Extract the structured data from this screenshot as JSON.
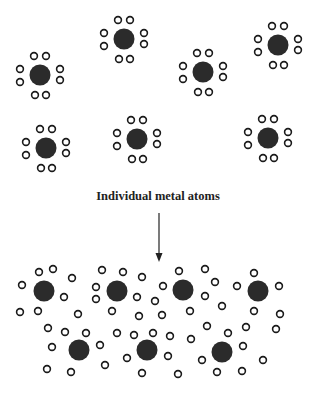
{
  "diagram": {
    "label": "Individual metal atoms",
    "colors": {
      "nucleus": "#2b2b2b",
      "electron_stroke": "#1a1a1a",
      "arrow": "#222222"
    },
    "top_atoms": [
      {
        "cx": 40,
        "cy": 75
      },
      {
        "cx": 124,
        "cy": 39
      },
      {
        "cx": 203,
        "cy": 72
      },
      {
        "cx": 278,
        "cy": 45
      },
      {
        "cx": 46,
        "cy": 148
      },
      {
        "cx": 137,
        "cy": 139
      },
      {
        "cx": 268,
        "cy": 138
      }
    ],
    "bottom_atoms": [
      {
        "cx": 44,
        "cy": 291
      },
      {
        "cx": 117,
        "cy": 291
      },
      {
        "cx": 183,
        "cy": 290
      },
      {
        "cx": 258,
        "cy": 291
      },
      {
        "cx": 79,
        "cy": 350
      },
      {
        "cx": 147,
        "cy": 350
      },
      {
        "cx": 222,
        "cy": 352
      }
    ],
    "sea_electrons": [
      [
        39,
        272
      ],
      [
        53,
        269
      ],
      [
        72,
        278
      ],
      [
        22,
        285
      ],
      [
        64,
        297
      ],
      [
        20,
        312
      ],
      [
        38,
        311
      ],
      [
        78,
        314
      ],
      [
        102,
        270
      ],
      [
        123,
        272
      ],
      [
        142,
        277
      ],
      [
        96,
        287
      ],
      [
        96,
        299
      ],
      [
        137,
        297
      ],
      [
        112,
        311
      ],
      [
        139,
        316
      ],
      [
        179,
        271
      ],
      [
        205,
        269
      ],
      [
        163,
        286
      ],
      [
        215,
        282
      ],
      [
        155,
        301
      ],
      [
        205,
        296
      ],
      [
        162,
        315
      ],
      [
        190,
        311
      ],
      [
        222,
        306
      ],
      [
        254,
        273
      ],
      [
        237,
        286
      ],
      [
        279,
        286
      ],
      [
        254,
        311
      ],
      [
        280,
        314
      ],
      [
        48,
        328
      ],
      [
        65,
        332
      ],
      [
        86,
        333
      ],
      [
        117,
        333
      ],
      [
        134,
        335
      ],
      [
        153,
        333
      ],
      [
        52,
        347
      ],
      [
        100,
        345
      ],
      [
        47,
        369
      ],
      [
        71,
        372
      ],
      [
        105,
        365
      ],
      [
        127,
        358
      ],
      [
        142,
        373
      ],
      [
        170,
        336
      ],
      [
        191,
        339
      ],
      [
        207,
        326
      ],
      [
        228,
        333
      ],
      [
        246,
        327
      ],
      [
        276,
        329
      ],
      [
        243,
        346
      ],
      [
        168,
        356
      ],
      [
        202,
        360
      ],
      [
        263,
        360
      ],
      [
        178,
        374
      ],
      [
        217,
        372
      ],
      [
        242,
        371
      ]
    ]
  }
}
